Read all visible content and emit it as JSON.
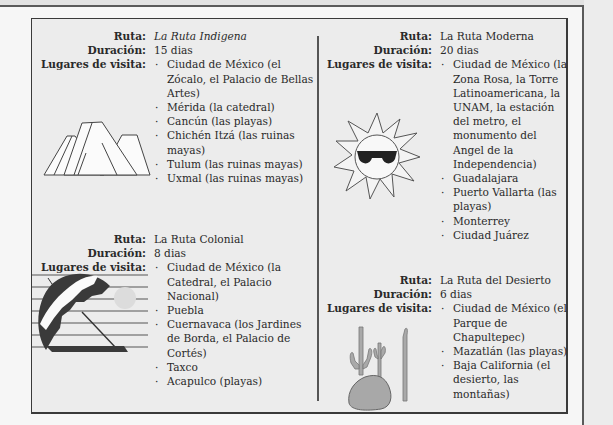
{
  "labels": {
    "route": "Ruta:",
    "duration": "Duración:",
    "places": "Lugares de visita:"
  },
  "routes": [
    {
      "name": "La Ruta Indigena",
      "duration": "15 dias",
      "places": [
        "Ciudad de México (el Zócalo, el Palacio de Bellas Artes)",
        "Mérida (la catedral)",
        "Cancún (las playas)",
        "Chichén Itzá (las ruinas mayas)",
        "Tulum (las ruinas mayas)",
        "Uxmal (las ruinas mayas)"
      ],
      "illustration": "pyramid-icon"
    },
    {
      "name": "La Ruta Colonial",
      "duration": "8 dias",
      "places": [
        "Ciudad de México (la Catedral, el Palacio Nacional)",
        "Puebla",
        "Cuernavaca (los Jardines de Borda, el Palacio de Cortés)",
        "Taxco",
        "Acapulco (playas)"
      ],
      "illustration": "beach-umbrella-icon"
    },
    {
      "name": "La Ruta Moderna",
      "duration": "20 dias",
      "places": [
        "Ciudad de México (la Zona Rosa, la Torre Latinoamericana, la UNAM, la estación del metro, el monumento del Angel de la Independencia)",
        "Guadalajara",
        "Puerto Vallarta (las playas)",
        "Monterrey",
        "Ciudad Juárez"
      ],
      "illustration": "sun-with-sunglasses-icon"
    },
    {
      "name": "La Ruta del Desierto",
      "duration": "6 dias",
      "places": [
        "Ciudad de México (el Parque de Chapultepec)",
        "Mazatlán (las playas)",
        "Baja California (el desierto, las montañas)"
      ],
      "illustration": "cactus-icon"
    }
  ]
}
